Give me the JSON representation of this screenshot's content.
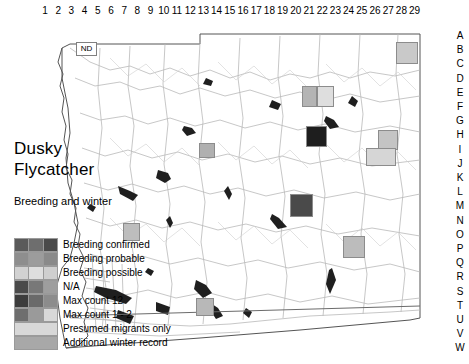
{
  "map": {
    "title_lines": [
      "Dusky",
      "Flycatcher"
    ],
    "subtitle": "Breeding and winter",
    "place_label": "ND",
    "column_labels": [
      "1",
      "2",
      "3",
      "4",
      "5",
      "6",
      "7",
      "8",
      "9",
      "10",
      "11",
      "12",
      "13",
      "14",
      "15",
      "16",
      "17",
      "18",
      "19",
      "20",
      "21",
      "22",
      "23",
      "24",
      "25",
      "26",
      "27",
      "28",
      "29"
    ],
    "row_labels": [
      "A",
      "B",
      "C",
      "D",
      "E",
      "F",
      "G",
      "H",
      "I",
      "J",
      "K",
      "L",
      "M",
      "N",
      "O",
      "P",
      "Q",
      "R",
      "S",
      "T",
      "U",
      "V",
      "W"
    ],
    "colors": {
      "background": "#ffffff",
      "county_outline": "#4d4d4d",
      "roads": "#b5b5b5",
      "water": "#1a1a1a",
      "grid_border": "#8c8c8c"
    }
  },
  "legend": {
    "entries": [
      {
        "label": "Breeding confirmed",
        "swatch": [
          "#5a5a5a",
          "#6e6e6e",
          "#4a4a4a"
        ],
        "full": false
      },
      {
        "label": "Breeding probable",
        "swatch": [
          "#8e8e8e",
          "#9c9c9c",
          "#8a8a8a"
        ],
        "full": false
      },
      {
        "label": "Breeding possible",
        "swatch": [
          "#d2d2d2",
          "#dedede",
          "#cfcfcf"
        ],
        "full": false
      },
      {
        "label": "N/A",
        "swatch": [
          "#4a4a4a",
          "#787878",
          "#9e9e9e"
        ],
        "full": false
      },
      {
        "label": "Max count 12",
        "swatch": [
          "#3c3c3c",
          "#6a6a6a",
          "#8c8c8c"
        ],
        "full": false
      },
      {
        "label": "Max count 1 - 2",
        "swatch": [
          "#6e6e6e",
          "#9a9a9a",
          "#d8d8d8"
        ],
        "full": false
      },
      {
        "label": "Presumed migrants only",
        "swatch": [
          "#d8d8d8"
        ],
        "full": true
      },
      {
        "label": "Additional winter record",
        "swatch": [
          "#a8a8a8"
        ],
        "full": true
      }
    ]
  },
  "data_cells": [
    {
      "col": 26,
      "row": "C",
      "x": 396,
      "y": 24,
      "w": 22,
      "h": 22,
      "fill": "#c9c9c9",
      "kind": "presumed-migrants-only"
    },
    {
      "col": 19,
      "row": "E",
      "x": 302,
      "y": 68,
      "w": 15,
      "h": 21,
      "fill": "#b4b4b4",
      "kind": "additional-winter-record"
    },
    {
      "col": 20,
      "row": "E",
      "x": 317,
      "y": 68,
      "w": 17,
      "h": 21,
      "fill": "#dedede",
      "kind": "breeding-possible"
    },
    {
      "col": 20,
      "row": "H",
      "x": 306,
      "y": 108,
      "w": 21,
      "h": 21,
      "fill": "#1e1e1e",
      "kind": "max-count-12"
    },
    {
      "col": 25,
      "row": "H",
      "x": 378,
      "y": 112,
      "w": 20,
      "h": 20,
      "fill": "#c4c4c4",
      "kind": "presumed-migrants-only"
    },
    {
      "col": 24,
      "row": "I",
      "x": 366,
      "y": 130,
      "w": 30,
      "h": 18,
      "fill": "#d6d6d6",
      "kind": "presumed-migrants-only"
    },
    {
      "col": 13,
      "row": "I",
      "x": 199,
      "y": 125,
      "w": 16,
      "h": 15,
      "fill": "#b0b0b0",
      "kind": "additional-winter-record"
    },
    {
      "col": 10,
      "row": "N",
      "x": 123,
      "y": 205,
      "w": 17,
      "h": 18,
      "fill": "#bdbdbd",
      "kind": "additional-winter-record"
    },
    {
      "col": 19,
      "row": "M",
      "x": 290,
      "y": 176,
      "w": 23,
      "h": 23,
      "fill": "#4a4a4a",
      "kind": "breeding-confirmed"
    },
    {
      "col": 22,
      "row": "P",
      "x": 343,
      "y": 218,
      "w": 22,
      "h": 22,
      "fill": "#bcbcbc",
      "kind": "additional-winter-record"
    },
    {
      "col": 13,
      "row": "T",
      "x": 196,
      "y": 280,
      "w": 18,
      "h": 18,
      "fill": "#b8b8b8",
      "kind": "additional-winter-record"
    }
  ]
}
